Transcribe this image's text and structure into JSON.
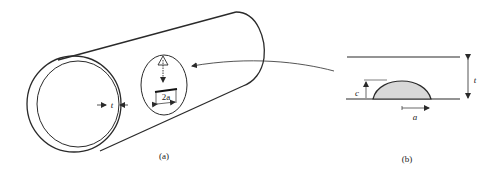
{
  "figure": {
    "panel_a": {
      "caption": "(a)",
      "thickness_label": "t",
      "crack_length_label": "2a"
    },
    "panel_b": {
      "caption": "(b)",
      "thickness_label": "t",
      "crack_depth_label": "c",
      "half_length_label": "a"
    },
    "colors": {
      "line": "#2a2a2a",
      "crack_fill": "#d8d8d8"
    }
  }
}
